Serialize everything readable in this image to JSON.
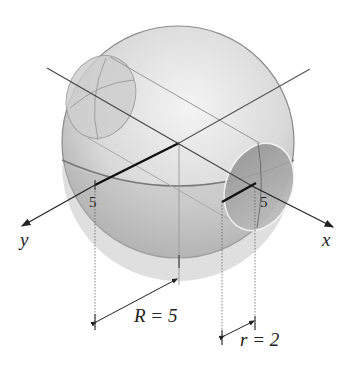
{
  "diagram": {
    "axes": {
      "x_label": "x",
      "y_label": "y",
      "x_tick": "5",
      "y_tick": "5"
    },
    "dimensions": {
      "big_radius": "R = 5",
      "small_radius": "r = 2"
    },
    "colors": {
      "sphere_fill": "#d6d6d6",
      "sphere_edge": "#8a8a8a",
      "hole_fill": "#a8a8a8",
      "axis": "#222222"
    }
  }
}
